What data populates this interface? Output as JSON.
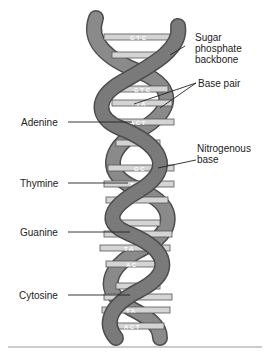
{
  "diagram": {
    "colors": {
      "backbone": "#7a7a7a",
      "backbone_dark": "#4d4d4d",
      "base": "#cfcfcf",
      "base_outline": "#555555",
      "leader_line": "#222222",
      "rule": "#888888"
    },
    "labels_right": [
      {
        "id": "sugar-phosphate",
        "text": "Sugar\nphosphate\nbackbone"
      },
      {
        "id": "base-pair",
        "text": "Base pair"
      },
      {
        "id": "nitrogenous-base",
        "text": "Nitrogenous\nbase"
      }
    ],
    "labels_left": [
      {
        "id": "adenine",
        "text": "Adenine"
      },
      {
        "id": "thymine",
        "text": "Thymine"
      },
      {
        "id": "guanine",
        "text": "Guanine"
      },
      {
        "id": "cytosine",
        "text": "Cytosine"
      }
    ],
    "base_pairs": [
      {
        "text": "G T C"
      },
      {
        "text": "G T C"
      },
      {
        "text": "T A"
      },
      {
        "text": "A C T"
      },
      {
        "text": "G C"
      },
      {
        "text": "T A"
      },
      {
        "text": "A C"
      },
      {
        "text": "G C"
      },
      {
        "text": "T A"
      },
      {
        "text": "A C"
      },
      {
        "text": "G C"
      },
      {
        "text": "T A"
      },
      {
        "text": "A C T"
      }
    ]
  }
}
